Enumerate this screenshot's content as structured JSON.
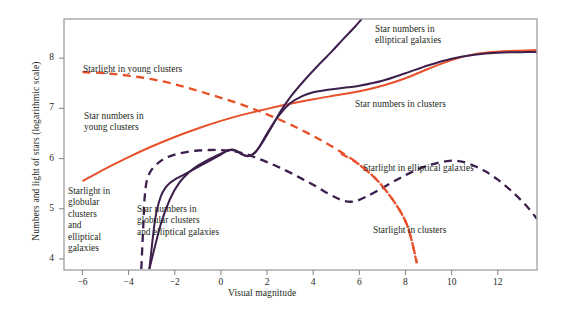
{
  "chart_data": {
    "type": "line",
    "title": "",
    "xlabel": "Visual magnitude",
    "ylabel": "Numbers and light of stars (logarithmic scale)",
    "xlim": [
      -6.8,
      13.7
    ],
    "ylim": [
      3.78,
      8.78
    ],
    "xticks": [
      -6,
      -4,
      -2,
      0,
      2,
      4,
      6,
      8,
      10,
      12
    ],
    "xtick_labels": [
      "−6",
      "−4",
      "−2",
      "0",
      "2",
      "4",
      "6",
      "8",
      "10",
      "12"
    ],
    "yticks": [
      4,
      5,
      6,
      7,
      8
    ],
    "ytick_labels": [
      "4",
      "5",
      "6",
      "7",
      "8"
    ],
    "grid": false,
    "legend_position": "inline-annotations",
    "colors": {
      "orange": "#E8502A",
      "purple": "#3D1F4E"
    },
    "series": [
      {
        "name": "Star numbers in young clusters",
        "color": "#E8502A",
        "style": "solid",
        "points": [
          [
            -6.0,
            5.55
          ],
          [
            -5.0,
            5.8
          ],
          [
            -4.0,
            6.03
          ],
          [
            -3.0,
            6.24
          ],
          [
            -2.0,
            6.43
          ],
          [
            -1.0,
            6.6
          ],
          [
            0.0,
            6.75
          ],
          [
            1.0,
            6.88
          ],
          [
            2.0,
            6.99
          ],
          [
            3.0,
            7.09
          ],
          [
            4.0,
            7.18
          ],
          [
            5.0,
            7.26
          ],
          [
            6.0,
            7.34
          ],
          [
            7.0,
            7.45
          ],
          [
            8.0,
            7.6
          ],
          [
            9.0,
            7.79
          ],
          [
            10.0,
            7.96
          ],
          [
            11.0,
            8.08
          ],
          [
            12.0,
            8.13
          ],
          [
            13.0,
            8.15
          ],
          [
            13.7,
            8.16
          ]
        ]
      },
      {
        "name": "Starlight in young clusters",
        "color": "#E8502A",
        "style": "dashed",
        "points": [
          [
            -6.0,
            7.72
          ],
          [
            -5.0,
            7.7
          ],
          [
            -4.0,
            7.65
          ],
          [
            -3.0,
            7.58
          ],
          [
            -2.0,
            7.48
          ],
          [
            -1.0,
            7.35
          ],
          [
            0.0,
            7.21
          ],
          [
            1.0,
            7.06
          ],
          [
            2.0,
            6.88
          ],
          [
            3.0,
            6.68
          ],
          [
            4.0,
            6.45
          ],
          [
            5.0,
            6.19
          ],
          [
            6.0,
            5.88
          ],
          [
            7.0,
            5.45
          ],
          [
            8.0,
            4.75
          ],
          [
            8.5,
            3.9
          ]
        ]
      },
      {
        "name": "Star numbers in globular clusters and elliptical galaxies",
        "color": "#3D1F4E",
        "style": "solid",
        "points": [
          [
            -3.1,
            3.8
          ],
          [
            -3.0,
            4.22
          ],
          [
            -2.9,
            4.62
          ],
          [
            -2.8,
            4.92
          ],
          [
            -2.6,
            5.25
          ],
          [
            -2.4,
            5.42
          ],
          [
            -2.2,
            5.52
          ],
          [
            -2.0,
            5.58
          ],
          [
            -1.6,
            5.68
          ],
          [
            -1.2,
            5.78
          ],
          [
            -0.8,
            5.88
          ],
          [
            -0.4,
            5.98
          ],
          [
            0.0,
            6.08
          ],
          [
            0.3,
            6.16
          ],
          [
            0.5,
            6.18
          ],
          [
            0.7,
            6.15
          ],
          [
            0.9,
            6.09
          ],
          [
            1.1,
            6.05
          ],
          [
            1.3,
            6.06
          ],
          [
            1.5,
            6.13
          ],
          [
            1.7,
            6.26
          ],
          [
            2.0,
            6.5
          ],
          [
            2.5,
            6.85
          ],
          [
            3.0,
            7.1
          ],
          [
            3.5,
            7.24
          ],
          [
            4.0,
            7.32
          ],
          [
            4.5,
            7.36
          ],
          [
            5.0,
            7.39
          ],
          [
            5.5,
            7.42
          ],
          [
            6.0,
            7.45
          ],
          [
            7.0,
            7.55
          ],
          [
            8.0,
            7.7
          ],
          [
            9.0,
            7.86
          ],
          [
            10.0,
            7.99
          ],
          [
            11.0,
            8.07
          ],
          [
            12.0,
            8.11
          ],
          [
            13.0,
            8.12
          ],
          [
            13.7,
            8.12
          ]
        ]
      },
      {
        "name": "Star numbers in elliptical galaxies",
        "color": "#3D1F4E",
        "style": "solid",
        "points": [
          [
            -3.1,
            3.8
          ],
          [
            -2.6,
            4.7
          ],
          [
            -2.2,
            5.2
          ],
          [
            -1.8,
            5.52
          ],
          [
            -1.4,
            5.72
          ],
          [
            -1.0,
            5.86
          ],
          [
            -0.5,
            5.99
          ],
          [
            0.0,
            6.1
          ],
          [
            0.3,
            6.16
          ],
          [
            0.6,
            6.16
          ],
          [
            0.9,
            6.09
          ],
          [
            1.2,
            6.05
          ],
          [
            1.5,
            6.13
          ],
          [
            1.8,
            6.32
          ],
          [
            2.2,
            6.63
          ],
          [
            2.6,
            6.95
          ],
          [
            3.0,
            7.22
          ],
          [
            3.6,
            7.55
          ],
          [
            4.2,
            7.85
          ],
          [
            4.8,
            8.13
          ],
          [
            5.3,
            8.38
          ],
          [
            5.8,
            8.62
          ],
          [
            6.1,
            8.78
          ]
        ]
      },
      {
        "name": "Starlight in globular clusters and elliptical galaxies",
        "color": "#3D1F4E",
        "style": "dashed",
        "points": [
          [
            -3.45,
            3.8
          ],
          [
            -3.4,
            4.3
          ],
          [
            -3.35,
            4.8
          ],
          [
            -3.3,
            5.25
          ],
          [
            -3.2,
            5.58
          ],
          [
            -3.0,
            5.78
          ],
          [
            -2.7,
            5.92
          ],
          [
            -2.4,
            6.01
          ],
          [
            -2.0,
            6.08
          ],
          [
            -1.5,
            6.13
          ],
          [
            -1.0,
            6.16
          ],
          [
            -0.5,
            6.17
          ],
          [
            0.0,
            6.17
          ],
          [
            0.5,
            6.15
          ],
          [
            1.0,
            6.1
          ],
          [
            1.5,
            6.02
          ],
          [
            2.0,
            5.93
          ],
          [
            2.5,
            5.83
          ],
          [
            3.0,
            5.72
          ],
          [
            3.5,
            5.6
          ],
          [
            4.0,
            5.48
          ],
          [
            4.5,
            5.34
          ],
          [
            5.0,
            5.22
          ],
          [
            5.3,
            5.16
          ],
          [
            5.6,
            5.14
          ],
          [
            5.9,
            5.16
          ],
          [
            6.3,
            5.24
          ],
          [
            6.8,
            5.36
          ],
          [
            7.4,
            5.52
          ],
          [
            8.0,
            5.67
          ],
          [
            8.6,
            5.8
          ],
          [
            9.2,
            5.89
          ],
          [
            9.8,
            5.95
          ],
          [
            10.3,
            5.95
          ],
          [
            10.8,
            5.89
          ],
          [
            11.4,
            5.76
          ],
          [
            12.0,
            5.58
          ],
          [
            12.6,
            5.35
          ],
          [
            13.2,
            5.08
          ],
          [
            13.7,
            4.8
          ]
        ]
      },
      {
        "name": "Starlight in clusters",
        "color": "#E8502A",
        "style": "dashed",
        "points": [
          [
            5.2,
            6.1
          ],
          [
            6.0,
            5.88
          ],
          [
            7.0,
            5.45
          ],
          [
            8.0,
            4.75
          ],
          [
            8.5,
            3.92
          ]
        ]
      }
    ],
    "annotations": [
      {
        "id": "starlight-young-clusters",
        "text": "Starlight in young clusters",
        "x": 83,
        "y": 64
      },
      {
        "id": "star-numbers-young-clusters",
        "text": "Star numbers in\nyoung clusters",
        "x": 84,
        "y": 111
      },
      {
        "id": "star-numbers-elliptical-galaxies",
        "text": "Star numbers in\nelliptical galaxies",
        "x": 375,
        "y": 24
      },
      {
        "id": "star-numbers-clusters",
        "text": "Star numbers in clusters",
        "x": 355,
        "y": 99
      },
      {
        "id": "starlight-globular-clusters",
        "text": "Starlight in\nglobular\nclusters\nand\nelliptical\ngalaxies",
        "x": 68,
        "y": 186
      },
      {
        "id": "star-numbers-globular-clusters",
        "text": "Star numbers in\nglobular clusters\nand elliptical galaxies",
        "x": 137,
        "y": 204
      },
      {
        "id": "starlight-elliptical-galaxies",
        "text": "Starlight in elliptical galaxies",
        "x": 363,
        "y": 163
      },
      {
        "id": "starlight-clusters",
        "text": "Starlight in clusters",
        "x": 373,
        "y": 225
      }
    ]
  }
}
